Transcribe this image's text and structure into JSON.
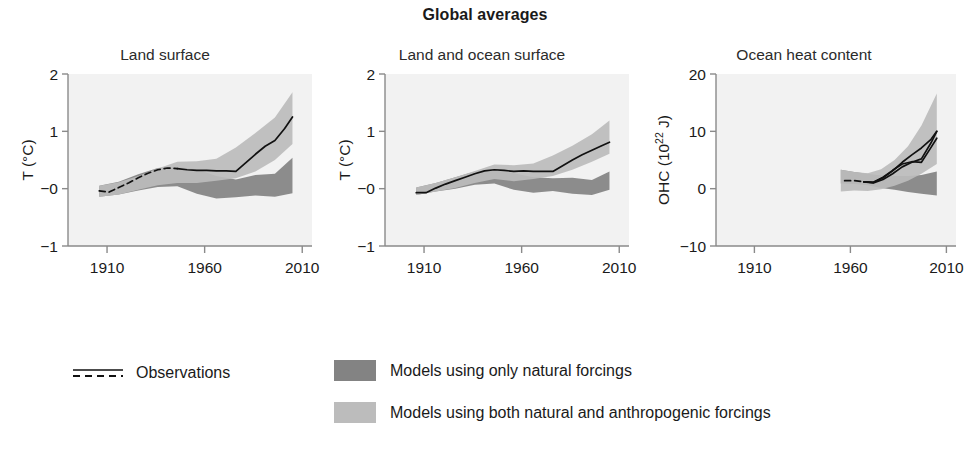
{
  "figure": {
    "title": "Global averages",
    "background_color": "#ffffff",
    "plot_background_color": "#f2f2f2",
    "axis_color": "#8a8a8a",
    "observation_line_color": "#111111"
  },
  "legend": {
    "position": "bottom",
    "observations": {
      "label": "Observations",
      "style": "solid line over dashed line"
    },
    "natural": {
      "label": "Models using only natural forcings",
      "color": "#838383"
    },
    "both": {
      "label": "Models using both natural and anthropogenic forcings",
      "color": "#bcbcbc"
    }
  },
  "chart_data": [
    {
      "type": "line",
      "title": "Land surface",
      "xlabel": "",
      "ylabel": "T (°C)",
      "ylabel_display": "T (°C)",
      "xlim": [
        1890,
        2015
      ],
      "ylim": [
        -1,
        2
      ],
      "xticks": [
        1910,
        1960,
        2010
      ],
      "xtick_labels": [
        "1910",
        "1960",
        "2010"
      ],
      "yticks": [
        -1,
        0,
        1,
        2
      ],
      "ytick_labels": [
        "−1",
        "−0",
        "1",
        "2"
      ],
      "grid": false,
      "series": [
        {
          "name": "Observations",
          "kind": "line",
          "x": [
            1906,
            1911,
            1916,
            1921,
            1926,
            1931,
            1936,
            1941,
            1946,
            1951,
            1956,
            1961,
            1966,
            1971,
            1976,
            1981,
            1986,
            1991,
            1996,
            2001,
            2005
          ],
          "values": [
            -0.04,
            -0.06,
            0.02,
            0.1,
            0.19,
            0.27,
            0.33,
            0.36,
            0.35,
            0.33,
            0.32,
            0.32,
            0.31,
            0.31,
            0.3,
            0.45,
            0.6,
            0.74,
            0.84,
            1.05,
            1.25
          ],
          "dashed_until": 1949
        },
        {
          "name": "Models using both natural and anthropogenic forcings",
          "kind": "band",
          "x": [
            1906,
            1916,
            1926,
            1936,
            1946,
            1956,
            1966,
            1976,
            1986,
            1996,
            2005
          ],
          "lower": [
            -0.14,
            -0.1,
            -0.02,
            0.06,
            0.1,
            0.1,
            0.14,
            0.18,
            0.3,
            0.5,
            0.78
          ],
          "upper": [
            0.05,
            0.11,
            0.22,
            0.35,
            0.47,
            0.48,
            0.52,
            0.72,
            0.97,
            1.24,
            1.68
          ]
        },
        {
          "name": "Models using only natural forcings",
          "kind": "band",
          "x": [
            1906,
            1916,
            1926,
            1936,
            1946,
            1956,
            1966,
            1976,
            1986,
            1996,
            2005
          ],
          "lower": [
            -0.14,
            -0.1,
            -0.03,
            0.03,
            0.04,
            -0.09,
            -0.17,
            -0.15,
            -0.12,
            -0.14,
            -0.08
          ],
          "upper": [
            0.05,
            0.12,
            0.25,
            0.36,
            0.38,
            0.34,
            0.22,
            0.16,
            0.24,
            0.26,
            0.54
          ]
        }
      ]
    },
    {
      "type": "line",
      "title": "Land and ocean surface",
      "xlabel": "",
      "ylabel": "T (°C)",
      "ylabel_display": "T (°C)",
      "xlim": [
        1890,
        2015
      ],
      "ylim": [
        -1,
        2
      ],
      "xticks": [
        1910,
        1960,
        2010
      ],
      "xtick_labels": [
        "1910",
        "1960",
        "2010"
      ],
      "yticks": [
        -1,
        0,
        1,
        2
      ],
      "ytick_labels": [
        "−1",
        "−0",
        "1",
        "2"
      ],
      "grid": false,
      "series": [
        {
          "name": "Observations",
          "kind": "line",
          "x": [
            1906,
            1911,
            1916,
            1921,
            1926,
            1931,
            1936,
            1941,
            1946,
            1951,
            1956,
            1961,
            1966,
            1971,
            1976,
            1981,
            1986,
            1991,
            1996,
            2001,
            2005
          ],
          "values": [
            -0.07,
            -0.07,
            0.01,
            0.08,
            0.14,
            0.2,
            0.26,
            0.31,
            0.33,
            0.32,
            0.3,
            0.31,
            0.3,
            0.3,
            0.3,
            0.4,
            0.5,
            0.59,
            0.67,
            0.75,
            0.81
          ],
          "dashed_until": 1906
        },
        {
          "name": "Models using both natural and anthropogenic forcings",
          "kind": "band",
          "x": [
            1906,
            1916,
            1926,
            1936,
            1946,
            1956,
            1966,
            1976,
            1986,
            1996,
            2005
          ],
          "lower": [
            -0.11,
            -0.05,
            0.01,
            0.1,
            0.17,
            0.13,
            0.17,
            0.22,
            0.33,
            0.47,
            0.61
          ],
          "upper": [
            0.02,
            0.1,
            0.2,
            0.31,
            0.42,
            0.41,
            0.44,
            0.58,
            0.75,
            0.95,
            1.19
          ]
        },
        {
          "name": "Models using only natural forcings",
          "kind": "band",
          "x": [
            1906,
            1916,
            1926,
            1936,
            1946,
            1956,
            1966,
            1976,
            1986,
            1996,
            2005
          ],
          "lower": [
            -0.11,
            -0.05,
            0.0,
            0.07,
            0.09,
            -0.02,
            -0.07,
            -0.04,
            -0.09,
            -0.11,
            -0.02
          ],
          "upper": [
            0.02,
            0.1,
            0.2,
            0.3,
            0.33,
            0.27,
            0.2,
            0.18,
            0.19,
            0.15,
            0.3
          ]
        }
      ]
    },
    {
      "type": "line",
      "title": "Ocean heat content",
      "xlabel": "",
      "ylabel": "OHC (10^22 J)",
      "ylabel_display": "OHC (10²² J)",
      "xlim": [
        1890,
        2015
      ],
      "ylim": [
        -10,
        20
      ],
      "xticks": [
        1910,
        1960,
        2010
      ],
      "xtick_labels": [
        "1910",
        "1960",
        "2010"
      ],
      "yticks": [
        -10,
        0,
        10,
        20
      ],
      "ytick_labels": [
        "−10",
        "0",
        "10",
        "20"
      ],
      "grid": false,
      "series": [
        {
          "name": "Observations",
          "kind": "line",
          "x": [
            1957,
            1962,
            1967,
            1972,
            1977,
            1982,
            1987,
            1992,
            1997,
            2002,
            2005
          ],
          "values": [
            1.4,
            1.4,
            1.2,
            1.1,
            1.9,
            3.1,
            4.6,
            5.9,
            7.1,
            8.6,
            10.0
          ],
          "dashed_until": 1969
        },
        {
          "name": "Observations 2",
          "kind": "line",
          "x": [
            1967,
            1972,
            1977,
            1982,
            1987,
            1992,
            1997,
            2002,
            2005
          ],
          "values": [
            1.2,
            1.0,
            1.6,
            2.6,
            3.8,
            4.6,
            5.2,
            8.0,
            10.0
          ]
        },
        {
          "name": "Observations 3",
          "kind": "line",
          "x": [
            1967,
            1972,
            1977,
            1982,
            1987,
            1992,
            1997,
            2002,
            2005
          ],
          "values": [
            1.2,
            1.1,
            2.0,
            3.2,
            4.3,
            4.7,
            4.6,
            7.2,
            8.8
          ]
        },
        {
          "name": "Models using both natural and anthropogenic forcings",
          "kind": "band",
          "x": [
            1955,
            1962,
            1969,
            1976,
            1983,
            1990,
            1997,
            2005
          ],
          "lower": [
            -0.5,
            -0.3,
            -0.4,
            -0.1,
            0.5,
            1.4,
            2.6,
            4.3
          ],
          "upper": [
            3.3,
            2.9,
            2.7,
            3.4,
            5.0,
            7.4,
            11.0,
            16.6
          ]
        },
        {
          "name": "Models using only natural forcings",
          "kind": "band",
          "x": [
            1955,
            1962,
            1969,
            1976,
            1983,
            1990,
            1997,
            2005
          ],
          "lower": [
            0.9,
            0.8,
            0.6,
            0.1,
            -0.2,
            -0.6,
            -0.9,
            -1.2
          ],
          "upper": [
            3.3,
            2.9,
            2.6,
            2.3,
            2.2,
            2.2,
            2.4,
            3.0
          ]
        }
      ]
    }
  ]
}
